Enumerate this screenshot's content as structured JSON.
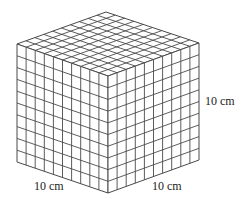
{
  "diagram": {
    "title": "",
    "grid_divisions": 10,
    "stroke_color": "#4a4a4a",
    "fill_color": "#ffffff",
    "vertices": {
      "top": [
        106,
        12
      ],
      "left": [
        17,
        44
      ],
      "right": [
        199,
        43
      ],
      "front": [
        108,
        76
      ],
      "bottom_left": [
        17,
        162
      ],
      "bottom_front": [
        108,
        193
      ],
      "bottom_right": [
        199,
        160
      ]
    },
    "labels": {
      "height": "10 cm",
      "left_edge": "10 cm",
      "right_edge": "10 cm"
    }
  }
}
